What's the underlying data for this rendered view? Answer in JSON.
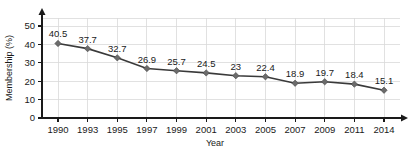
{
  "chart_data": {
    "type": "line",
    "title": "",
    "xlabel": "Year",
    "ylabel": "Membership (%)",
    "categories": [
      "1990",
      "1993",
      "1995",
      "1997",
      "1999",
      "2001",
      "2003",
      "2005",
      "2007",
      "2009",
      "2011",
      "2014"
    ],
    "values": [
      40.5,
      37.7,
      32.7,
      26.9,
      25.7,
      24.5,
      23,
      22.4,
      18.9,
      19.7,
      18.4,
      15.1
    ],
    "point_labels": [
      "40.5",
      "37.7",
      "32.7",
      "26.9",
      "25.7",
      "24.5",
      "23",
      "22.4",
      "18.9",
      "19.7",
      "18.4",
      "15.1"
    ],
    "ylim": [
      0,
      50
    ],
    "yticks": [
      0,
      10,
      20,
      30,
      40,
      50
    ],
    "ytick_labels": [
      "0",
      "10",
      "20",
      "30",
      "40",
      "50"
    ],
    "grid": true,
    "grid_horizontal": true,
    "grid_vertical": true,
    "legend": false,
    "legend_position": "none",
    "series_color": "#3a3a3a",
    "marker_color": "#6b6b6b",
    "marker_shape": "diamond",
    "grid_color": "#d9d9d9",
    "axis_color": "#1a1a1a",
    "axis_arrows": true
  },
  "axis": {
    "y_title": "Membership (%)",
    "x_title": "Year"
  }
}
